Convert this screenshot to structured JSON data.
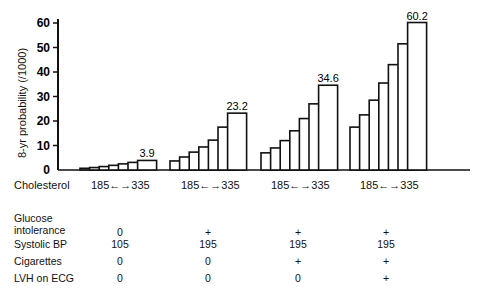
{
  "chart_data": {
    "type": "bar",
    "title": "",
    "ylabel": "8-yr probability (/1000)",
    "xlabel": "Cholesterol",
    "ylim": [
      0,
      60
    ],
    "yticks": [
      0,
      10,
      20,
      30,
      40,
      50,
      60
    ],
    "grid": false,
    "x_range_label": "185 ←→ 335",
    "cholesterol_levels": [
      185,
      210,
      235,
      260,
      285,
      310,
      335
    ],
    "groups": [
      {
        "name": "Group 1",
        "values": [
          0.7,
          1.0,
          1.4,
          1.9,
          2.5,
          3.1,
          3.9
        ],
        "top_label": "3.9",
        "glucose_intolerance": "0",
        "systolic_bp": "105",
        "cigarettes": "0",
        "lvh_on_ecg": "0"
      },
      {
        "name": "Group 2",
        "values": [
          3.7,
          5.3,
          7.3,
          9.4,
          12.2,
          17.5,
          23.2
        ],
        "top_label": "23.2",
        "glucose_intolerance": "+",
        "systolic_bp": "195",
        "cigarettes": "0",
        "lvh_on_ecg": "0"
      },
      {
        "name": "Group 3",
        "values": [
          7.0,
          9.0,
          12.0,
          16.0,
          21.0,
          27.0,
          34.6
        ],
        "top_label": "34.6",
        "glucose_intolerance": "+",
        "systolic_bp": "195",
        "cigarettes": "+",
        "lvh_on_ecg": "0"
      },
      {
        "name": "Group 4",
        "values": [
          17.5,
          22.5,
          28.5,
          35.5,
          43.0,
          51.5,
          60.2
        ],
        "top_label": "60.2",
        "glucose_intolerance": "+",
        "systolic_bp": "195",
        "cigarettes": "+",
        "lvh_on_ecg": "+"
      }
    ]
  },
  "table": {
    "row_labels": {
      "glucose_line1": "Glucose",
      "glucose_line2": "intolerance",
      "systolic_bp": "Systolic BP",
      "cigarettes": "Cigarettes",
      "lvh_on_ecg": "LVH on ECG"
    }
  },
  "labels": {
    "cholesterol": "Cholesterol",
    "range_from": "185",
    "range_to": "335"
  }
}
